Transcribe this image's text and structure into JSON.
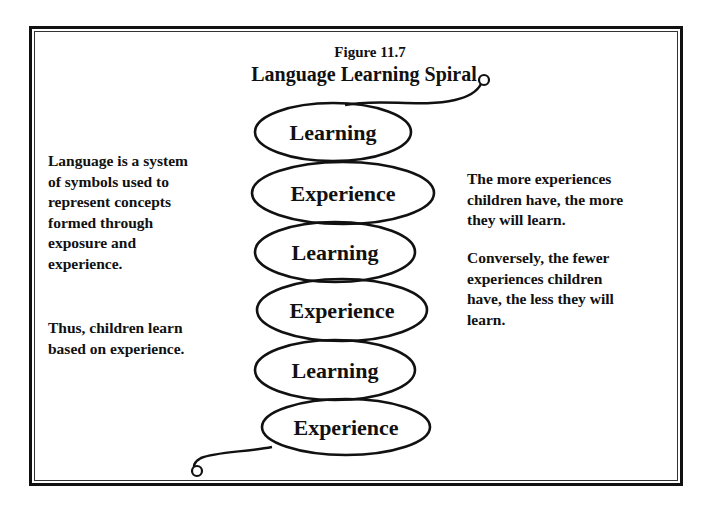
{
  "figure": {
    "label": "Figure 11.7",
    "title": "Language Learning Spiral"
  },
  "spiral": {
    "items": [
      {
        "label": "Learning"
      },
      {
        "label": "Experience"
      },
      {
        "label": "Learning"
      },
      {
        "label": "Experience"
      },
      {
        "label": "Learning"
      },
      {
        "label": "Experience"
      }
    ]
  },
  "left_text": {
    "paragraph_1": "Language is a system of symbols used to represent concepts formed through exposure and experience.",
    "paragraph_1_lines": [
      "Language is a system",
      "of symbols used to",
      "represent concepts",
      "formed through",
      "exposure and",
      "experience."
    ],
    "paragraph_2_lines": [
      "Thus, children learn",
      "based on experience."
    ]
  },
  "right_text": {
    "paragraph_1_lines": [
      "The more experiences",
      "children have, the more",
      "they will learn."
    ],
    "paragraph_2_lines": [
      "Conversely, the fewer",
      "experiences children",
      "have, the less they will",
      "learn."
    ]
  }
}
